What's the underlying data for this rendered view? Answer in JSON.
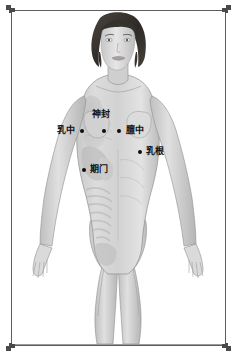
{
  "image": {
    "title": "女性胸腹部穴位图",
    "subject": "female-anatomical-figure-front-view",
    "background_color": "#ffffff",
    "frame_color": "#5d5d5d",
    "point_color": "#0d0d0d",
    "label_color": "#111111"
  },
  "frame": {
    "corners": [
      "top-left",
      "top-right",
      "bottom-left",
      "bottom-right"
    ],
    "style": "stepped-bracket"
  },
  "acupoints": [
    {
      "id": "shen-feng",
      "label": "神封",
      "dot_x": 104,
      "dot_y": 131,
      "label_x": 92,
      "label_y": 110,
      "label_align": "center"
    },
    {
      "id": "ru-zhong",
      "label": "乳中",
      "dot_x": 82,
      "dot_y": 131,
      "label_x": 58,
      "label_y": 127,
      "label_align": "right"
    },
    {
      "id": "dan-zhong",
      "label": "膻中",
      "dot_x": 119,
      "dot_y": 131,
      "label_x": 126,
      "label_y": 127,
      "label_align": "left"
    },
    {
      "id": "ru-gen",
      "label": "乳根",
      "dot_x": 140,
      "dot_y": 152,
      "label_x": 147,
      "label_y": 148,
      "label_align": "left"
    },
    {
      "id": "qi-men",
      "label": "期门",
      "dot_x": 84,
      "dot_y": 170,
      "label_x": 91,
      "label_y": 166,
      "label_align": "left"
    }
  ],
  "figure": {
    "hair": "short dark bob",
    "rendering": "left half shows internal organs semi-transparent, right half shows skin surface",
    "skin_tone": "#d8d8d8",
    "hair_color": "#3a3632",
    "organ_tone": "#bdbdbd",
    "ground_line_color": "#9a9a9a"
  }
}
